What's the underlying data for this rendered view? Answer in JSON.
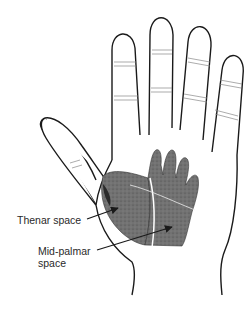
{
  "figure": {
    "labels": {
      "thenar": "Thenar space",
      "midpalmar_line1": "Mid-palmar",
      "midpalmar_line2": "space"
    },
    "colors": {
      "outline": "#1a1a1a",
      "shaded_space": "#6e6e6e",
      "background": "#ffffff",
      "label_text": "#2a2a2a"
    }
  }
}
